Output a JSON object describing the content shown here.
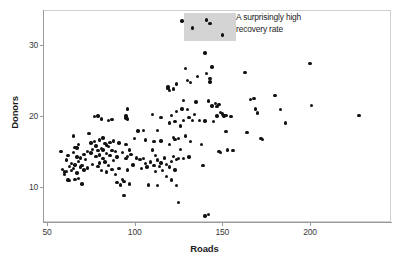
{
  "chart_data": {
    "type": "scatter",
    "title": "",
    "xlabel": "Roads",
    "ylabel": "Donors",
    "xlim": [
      42,
      240
    ],
    "ylim": [
      5.0,
      34.5
    ],
    "xticks": [
      50,
      100,
      150,
      200
    ],
    "yticks": [
      10,
      20,
      30
    ],
    "xticklabels": [
      "50",
      "100",
      "150",
      "200"
    ],
    "yticklabels": [
      "10",
      "20",
      "30"
    ],
    "grid": false,
    "legend": null,
    "marker": "filled-circle",
    "marker_color": "#121212",
    "marker_size_px": 3.4,
    "frame_color": "#cfcfcf",
    "background": "#ffffff",
    "annotations": [
      {
        "name": "recovery-rate-callout",
        "text_lines": [
          "A surprisingly high",
          "recovery rate"
        ],
        "text": "A surprisingly high recovery rate",
        "highlight_rect": {
          "x_range": [
            128,
            158
          ],
          "y_range": [
            30.6,
            34.5
          ],
          "color": "#d4d4d4"
        }
      }
    ],
    "points": [
      [
        58,
        15.0
      ],
      [
        59,
        12.5
      ],
      [
        60,
        12.1
      ],
      [
        60,
        11.8
      ],
      [
        61,
        13.8
      ],
      [
        61,
        12.2
      ],
      [
        62,
        14.4
      ],
      [
        62,
        11.0
      ],
      [
        63,
        12.9
      ],
      [
        63,
        10.9
      ],
      [
        64,
        13.3
      ],
      [
        64,
        12.3
      ],
      [
        65,
        17.2
      ],
      [
        65,
        14.9
      ],
      [
        65,
        12.6
      ],
      [
        66,
        15.6
      ],
      [
        66,
        13.1
      ],
      [
        66,
        11.1
      ],
      [
        67,
        15.5
      ],
      [
        67,
        14.2
      ],
      [
        67,
        12.0
      ],
      [
        68,
        16.0
      ],
      [
        68,
        13.6
      ],
      [
        68,
        11.2
      ],
      [
        69,
        14.1
      ],
      [
        69,
        12.8
      ],
      [
        70,
        13.0
      ],
      [
        70,
        10.4
      ],
      [
        71,
        14.6
      ],
      [
        71,
        12.4
      ],
      [
        72,
        13.9
      ],
      [
        73,
        15.0
      ],
      [
        73,
        12.7
      ],
      [
        74,
        17.5
      ],
      [
        75,
        16.2
      ],
      [
        75,
        14.8
      ],
      [
        76,
        15.3
      ],
      [
        76,
        13.2
      ],
      [
        77,
        19.9
      ],
      [
        77,
        16.4
      ],
      [
        78,
        15.8
      ],
      [
        78,
        14.3
      ],
      [
        79,
        20.0
      ],
      [
        79,
        15.1
      ],
      [
        79,
        12.9
      ],
      [
        80,
        16.6
      ],
      [
        80,
        14.5
      ],
      [
        80,
        13.4
      ],
      [
        81,
        19.6
      ],
      [
        81,
        15.4
      ],
      [
        81,
        12.3
      ],
      [
        82,
        16.9
      ],
      [
        82,
        15.2
      ],
      [
        82,
        14.0
      ],
      [
        83,
        16.1
      ],
      [
        83,
        13.5
      ],
      [
        84,
        15.9
      ],
      [
        84,
        14.7
      ],
      [
        84,
        12.1
      ],
      [
        85,
        19.4
      ],
      [
        85,
        15.7
      ],
      [
        85,
        13.0
      ],
      [
        86,
        16.3
      ],
      [
        86,
        14.4
      ],
      [
        87,
        19.5
      ],
      [
        87,
        15.1
      ],
      [
        87,
        12.5
      ],
      [
        88,
        16.5
      ],
      [
        88,
        13.7
      ],
      [
        89,
        15.0
      ],
      [
        89,
        11.8
      ],
      [
        90,
        14.2
      ],
      [
        90,
        10.6
      ],
      [
        91,
        16.2
      ],
      [
        91,
        12.6
      ],
      [
        92,
        10.3
      ],
      [
        93,
        14.9
      ],
      [
        93,
        11.1
      ],
      [
        94,
        10.8
      ],
      [
        94,
        8.8
      ],
      [
        95,
        19.7
      ],
      [
        95,
        20.0
      ],
      [
        95,
        16.0
      ],
      [
        95,
        14.0
      ],
      [
        96,
        21.0
      ],
      [
        96,
        19.6
      ],
      [
        96,
        14.3
      ],
      [
        96,
        12.4
      ],
      [
        97,
        15.2
      ],
      [
        97,
        10.4
      ],
      [
        98,
        14.6
      ],
      [
        99,
        13.1
      ],
      [
        100,
        16.8
      ],
      [
        101,
        14.1
      ],
      [
        102,
        17.9
      ],
      [
        103,
        13.9
      ],
      [
        104,
        12.6
      ],
      [
        105,
        18.0
      ],
      [
        105,
        14.0
      ],
      [
        106,
        16.6
      ],
      [
        106,
        13.3
      ],
      [
        107,
        12.8
      ],
      [
        108,
        10.3
      ],
      [
        109,
        13.5
      ],
      [
        110,
        20.2
      ],
      [
        110,
        15.2
      ],
      [
        111,
        16.4
      ],
      [
        111,
        13.0
      ],
      [
        112,
        14.4
      ],
      [
        112,
        12.2
      ],
      [
        113,
        18.0
      ],
      [
        113,
        13.8
      ],
      [
        113,
        10.2
      ],
      [
        114,
        12.9
      ],
      [
        115,
        19.8
      ],
      [
        115,
        16.5
      ],
      [
        115,
        13.4
      ],
      [
        116,
        12.3
      ],
      [
        117,
        14.1
      ],
      [
        118,
        11.5
      ],
      [
        118,
        13.2
      ],
      [
        119,
        23.9
      ],
      [
        119,
        24.1
      ],
      [
        120,
        23.6
      ],
      [
        120,
        19.0
      ],
      [
        120,
        16.0
      ],
      [
        120,
        12.8
      ],
      [
        121,
        20.1
      ],
      [
        121,
        13.6
      ],
      [
        121,
        11.0
      ],
      [
        122,
        23.8
      ],
      [
        122,
        17.0
      ],
      [
        122,
        14.3
      ],
      [
        123,
        19.2
      ],
      [
        123,
        16.7
      ],
      [
        123,
        12.4
      ],
      [
        124,
        24.5
      ],
      [
        124,
        20.6
      ],
      [
        124,
        13.9
      ],
      [
        124,
        10.2
      ],
      [
        125,
        16.8
      ],
      [
        125,
        14.0
      ],
      [
        125,
        7.8
      ],
      [
        126,
        18.6
      ],
      [
        126,
        15.3
      ],
      [
        127,
        33.4
      ],
      [
        127,
        21.0
      ],
      [
        128,
        22.2
      ],
      [
        128,
        19.4
      ],
      [
        128,
        14.0
      ],
      [
        129,
        26.7
      ],
      [
        129,
        17.2
      ],
      [
        130,
        25.0
      ],
      [
        130,
        20.9
      ],
      [
        131,
        19.8
      ],
      [
        131,
        14.2
      ],
      [
        132,
        24.7
      ],
      [
        132,
        16.4
      ],
      [
        133,
        32.4
      ],
      [
        133,
        19.4
      ],
      [
        134,
        20.2
      ],
      [
        135,
        22.0
      ],
      [
        136,
        25.6
      ],
      [
        137,
        19.4
      ],
      [
        138,
        16.0
      ],
      [
        139,
        13.0
      ],
      [
        140,
        28.9
      ],
      [
        140,
        19.3
      ],
      [
        140,
        5.9
      ],
      [
        141,
        33.5
      ],
      [
        141,
        26.0
      ],
      [
        142,
        22.1
      ],
      [
        142,
        6.1
      ],
      [
        143,
        33.0
      ],
      [
        143,
        25.3
      ],
      [
        143,
        24.8
      ],
      [
        144,
        26.9
      ],
      [
        144,
        21.4
      ],
      [
        145,
        19.2
      ],
      [
        146,
        21.8
      ],
      [
        147,
        21.3
      ],
      [
        147,
        20.0
      ],
      [
        148,
        21.6
      ],
      [
        148,
        15.0
      ],
      [
        149,
        20.5
      ],
      [
        149,
        14.9
      ],
      [
        150,
        31.4
      ],
      [
        150,
        20.3
      ],
      [
        151,
        20.0
      ],
      [
        152,
        20.1
      ],
      [
        152,
        17.8
      ],
      [
        153,
        15.2
      ],
      [
        155,
        19.9
      ],
      [
        156,
        15.1
      ],
      [
        163,
        26.1
      ],
      [
        164,
        17.7
      ],
      [
        166,
        22.3
      ],
      [
        168,
        22.5
      ],
      [
        169,
        21.0
      ],
      [
        170,
        20.4
      ],
      [
        172,
        16.8
      ],
      [
        173,
        16.7
      ],
      [
        180,
        22.9
      ],
      [
        183,
        20.9
      ],
      [
        186,
        19.0
      ],
      [
        200,
        27.4
      ],
      [
        201,
        21.5
      ],
      [
        228,
        20.1
      ]
    ]
  },
  "axis": {
    "x_title": "Roads",
    "y_title": "Donors"
  }
}
